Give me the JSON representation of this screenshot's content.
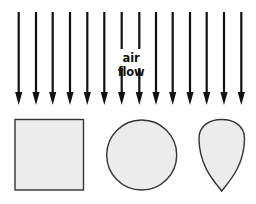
{
  "diagram": {
    "label": "air flow",
    "colors": {
      "arrow": "#111111",
      "shape_fill": "#ececec",
      "shape_stroke": "#333333",
      "background": "#ffffff"
    },
    "arrows": {
      "count": 14,
      "x_positions": [
        18.7,
        36,
        52.7,
        70,
        87.3,
        104.3,
        121.7,
        139.3,
        156,
        172.7,
        190,
        206.7,
        224,
        241.3
      ],
      "top_y": 12,
      "tip_y": 105,
      "broken_by_label": [
        6,
        7
      ]
    },
    "shapes": [
      {
        "name": "square",
        "x": 15,
        "y": 119.5,
        "w": 68.5,
        "h": 70.5
      },
      {
        "name": "circle",
        "cx": 141.7,
        "cy": 155,
        "r": 35
      },
      {
        "name": "teardrop",
        "left": 199,
        "right": 244.5,
        "top": 119.5,
        "tip_x": 221.7,
        "tip_y": 191
      }
    ]
  }
}
